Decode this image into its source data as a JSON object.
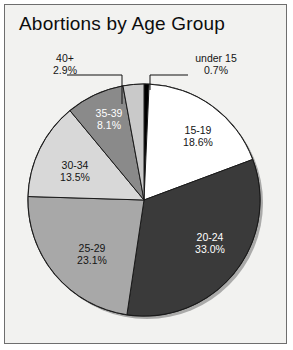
{
  "chart": {
    "title": "Abortions by Age Group"
  },
  "chart_data": {
    "type": "pie",
    "title": "Abortions by Age Group",
    "xlabel": "",
    "ylabel": "",
    "units": "percent",
    "start_angle_deg": 0,
    "direction": "clockwise",
    "legend": "none",
    "grid": false,
    "labels_inside": true,
    "categories": [
      "under 15",
      "15-19",
      "20-24",
      "25-29",
      "30-34",
      "35-39",
      "40+"
    ],
    "values": [
      0.7,
      18.6,
      33.0,
      23.1,
      13.5,
      8.1,
      2.9
    ],
    "value_labels": [
      "0.7%",
      "18.6%",
      "33.0%",
      "23.1%",
      "13.5%",
      "8.1%",
      "2.9%"
    ],
    "colors": [
      "#000000",
      "#ffffff",
      "#3a3a3a",
      "#a8a8a8",
      "#d8d8d8",
      "#8a8a8a",
      "#c9c9c9"
    ],
    "slices": [
      {
        "name": "under 15",
        "value": 0.7,
        "label": "under 15",
        "pct": "0.7%",
        "color": "#000000",
        "text_color": "#141414",
        "label_placement": "callout"
      },
      {
        "name": "15-19",
        "value": 18.6,
        "label": "15-19",
        "pct": "18.6%",
        "color": "#ffffff",
        "text_color": "#141414",
        "label_placement": "inside"
      },
      {
        "name": "20-24",
        "value": 33.0,
        "label": "20-24",
        "pct": "33.0%",
        "color": "#3a3a3a",
        "text_color": "#ffffff",
        "label_placement": "inside"
      },
      {
        "name": "25-29",
        "value": 23.1,
        "label": "25-29",
        "pct": "23.1%",
        "color": "#a8a8a8",
        "text_color": "#141414",
        "label_placement": "inside"
      },
      {
        "name": "30-34",
        "value": 13.5,
        "label": "30-34",
        "pct": "13.5%",
        "color": "#d8d8d8",
        "text_color": "#141414",
        "label_placement": "inside"
      },
      {
        "name": "35-39",
        "value": 8.1,
        "label": "35-39",
        "pct": "8.1%",
        "color": "#8a8a8a",
        "text_color": "#ffffff",
        "label_placement": "inside"
      },
      {
        "name": "40+",
        "value": 2.9,
        "label": "40+",
        "pct": "2.9%",
        "color": "#c9c9c9",
        "text_color": "#141414",
        "label_placement": "callout"
      }
    ]
  },
  "style": {
    "frame_border": "#6e6e6e",
    "background": "#f2f2f0",
    "outline": "#1a1a1a",
    "shadow": "#2e2e2e"
  }
}
